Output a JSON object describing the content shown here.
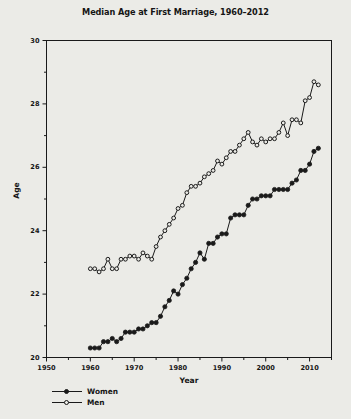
{
  "chart_data": {
    "type": "line",
    "title": "Median Age at First Marriage, 1960–2012",
    "xlabel": "Year",
    "ylabel": "Age",
    "xlim": [
      1950,
      2015
    ],
    "ylim": [
      20,
      30
    ],
    "xticks": [
      1950,
      1960,
      1970,
      1980,
      1990,
      2000,
      2010
    ],
    "yticks": [
      20,
      22,
      24,
      26,
      28,
      30
    ],
    "xminor_step": 5,
    "yminor_step": 1,
    "grid": false,
    "legend_position": "below-axes-left",
    "x": [
      1960,
      1961,
      1962,
      1963,
      1964,
      1965,
      1966,
      1967,
      1968,
      1969,
      1970,
      1971,
      1972,
      1973,
      1974,
      1975,
      1976,
      1977,
      1978,
      1979,
      1980,
      1981,
      1982,
      1983,
      1984,
      1985,
      1986,
      1987,
      1988,
      1989,
      1990,
      1991,
      1992,
      1993,
      1994,
      1995,
      1996,
      1997,
      1998,
      1999,
      2000,
      2001,
      2002,
      2003,
      2004,
      2005,
      2006,
      2007,
      2008,
      2009,
      2010,
      2011,
      2012
    ],
    "series": [
      {
        "name": "Women",
        "marker": "filled-circle",
        "color": "#1a1a1a",
        "values": [
          20.3,
          20.3,
          20.3,
          20.5,
          20.5,
          20.6,
          20.5,
          20.6,
          20.8,
          20.8,
          20.8,
          20.9,
          20.9,
          21.0,
          21.1,
          21.1,
          21.3,
          21.6,
          21.8,
          22.1,
          22.0,
          22.3,
          22.5,
          22.8,
          23.0,
          23.3,
          23.1,
          23.6,
          23.6,
          23.8,
          23.9,
          23.9,
          24.4,
          24.5,
          24.5,
          24.5,
          24.8,
          25.0,
          25.0,
          25.1,
          25.1,
          25.1,
          25.3,
          25.3,
          25.3,
          25.3,
          25.5,
          25.6,
          25.9,
          25.9,
          26.1,
          26.5,
          26.6
        ]
      },
      {
        "name": "Men",
        "marker": "open-circle",
        "color": "#1a1a1a",
        "values": [
          22.8,
          22.8,
          22.7,
          22.8,
          23.1,
          22.8,
          22.8,
          23.1,
          23.1,
          23.2,
          23.2,
          23.1,
          23.3,
          23.2,
          23.1,
          23.5,
          23.8,
          24.0,
          24.2,
          24.4,
          24.7,
          24.8,
          25.2,
          25.4,
          25.4,
          25.5,
          25.7,
          25.8,
          25.9,
          26.2,
          26.1,
          26.3,
          26.5,
          26.5,
          26.7,
          26.9,
          27.1,
          26.8,
          26.7,
          26.9,
          26.8,
          26.9,
          26.9,
          27.1,
          27.4,
          27.0,
          27.5,
          27.5,
          27.4,
          28.1,
          28.2,
          28.7,
          28.6
        ]
      }
    ]
  },
  "legend": {
    "items": [
      {
        "label": "Women"
      },
      {
        "label": "Men"
      }
    ]
  }
}
